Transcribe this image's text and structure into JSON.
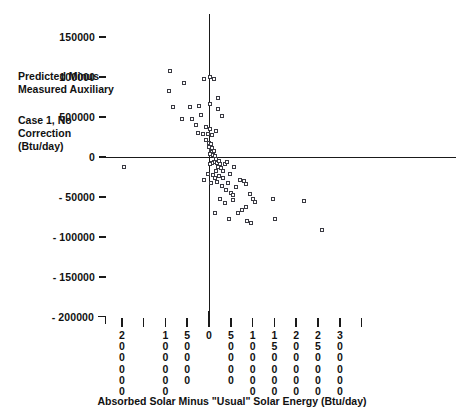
{
  "chart_data": {
    "type": "scatter",
    "title": "",
    "xlabel": "Absorbed Solar Minus \"Usual\" Solar Energy (Btu/day)",
    "ylabel": "Predicted Minus Measured Auxiliary Case 1, No Correction (Btu/day)",
    "ylabel_lines": [
      "Predicted Minus",
      "Measured Auxiliary",
      "Case 1, No",
      "Correction",
      "(Btu/day)"
    ],
    "xlim": [
      -200000,
      350000
    ],
    "ylim": [
      -200000,
      150000
    ],
    "grid": false,
    "legend": null,
    "marker": "open-square",
    "x_ticks": [
      {
        "value": -200000,
        "label": "200000",
        "label_shown": true
      },
      {
        "value": -150000,
        "label": "",
        "label_shown": false
      },
      {
        "value": -100000,
        "label": "100000",
        "label_shown": true
      },
      {
        "value": -50000,
        "label": "50000",
        "label_shown": true
      },
      {
        "value": 0,
        "label": "0",
        "label_shown": true
      },
      {
        "value": 50000,
        "label": "50000",
        "label_shown": true
      },
      {
        "value": 100000,
        "label": "100000",
        "label_shown": true
      },
      {
        "value": 150000,
        "label": "150000",
        "label_shown": true
      },
      {
        "value": 200000,
        "label": "200000",
        "label_shown": true
      },
      {
        "value": 250000,
        "label": "250000",
        "label_shown": true
      },
      {
        "value": 300000,
        "label": "300000",
        "label_shown": true
      },
      {
        "value": 350000,
        "label": "",
        "label_shown": false
      }
    ],
    "y_ticks": [
      {
        "value": 150000,
        "label": "150000"
      },
      {
        "value": 100000,
        "label": "100000"
      },
      {
        "value": 50000,
        "label": "500000"
      },
      {
        "value": 0,
        "label": "0"
      },
      {
        "value": -50000,
        "label": "- 50000"
      },
      {
        "value": -100000,
        "label": "- 100000"
      },
      {
        "value": -150000,
        "label": "- 150000"
      },
      {
        "value": -200000,
        "label": "- 200000"
      }
    ],
    "points": [
      [
        -89000,
        108000
      ],
      [
        -92000,
        82000
      ],
      [
        -58000,
        92000
      ],
      [
        -82000,
        62000
      ],
      [
        -43000,
        63000
      ],
      [
        -24000,
        64000
      ],
      [
        -12000,
        97000
      ],
      [
        -62000,
        48000
      ],
      [
        -38000,
        47000
      ],
      [
        -18000,
        52000
      ],
      [
        -30000,
        40000
      ],
      [
        -8000,
        37000
      ],
      [
        3000,
        100000
      ],
      [
        1500,
        66000
      ],
      [
        11000,
        97000
      ],
      [
        21000,
        74000
      ],
      [
        20000,
        60000
      ],
      [
        30000,
        51000
      ],
      [
        -25000,
        30000
      ],
      [
        -14000,
        29000
      ],
      [
        -2000,
        29000
      ],
      [
        2000,
        35000
      ],
      [
        7000,
        28000
      ],
      [
        16000,
        32000
      ],
      [
        -6000,
        21000
      ],
      [
        1000,
        18000
      ],
      [
        3000,
        14000
      ],
      [
        5000,
        16000
      ],
      [
        -1000,
        12000
      ],
      [
        4000,
        9000
      ],
      [
        6000,
        6000
      ],
      [
        2000,
        4000
      ],
      [
        8000,
        11000
      ],
      [
        12000,
        7000
      ],
      [
        9000,
        2000
      ],
      [
        14000,
        1000
      ],
      [
        16000,
        -3000
      ],
      [
        11000,
        -6000
      ],
      [
        18000,
        -7000
      ],
      [
        6000,
        -8000
      ],
      [
        3000,
        -9000
      ],
      [
        22000,
        -5000
      ],
      [
        25000,
        -9000
      ],
      [
        20000,
        -13000
      ],
      [
        27000,
        -14000
      ],
      [
        16000,
        -17000
      ],
      [
        31000,
        -18000
      ],
      [
        36000,
        -9000
      ],
      [
        41000,
        -6000
      ],
      [
        -3000,
        -21000
      ],
      [
        9000,
        -22000
      ],
      [
        13000,
        -26000
      ],
      [
        24000,
        -24000
      ],
      [
        33000,
        -26000
      ],
      [
        48000,
        -21000
      ],
      [
        58000,
        -12000
      ],
      [
        -12000,
        -29000
      ],
      [
        5000,
        -33000
      ],
      [
        19000,
        -31000
      ],
      [
        29000,
        -36000
      ],
      [
        44000,
        -32000
      ],
      [
        39000,
        -41000
      ],
      [
        61000,
        -37000
      ],
      [
        71000,
        -29000
      ],
      [
        81000,
        -30000
      ],
      [
        84000,
        -34000
      ],
      [
        51000,
        -45000
      ],
      [
        56000,
        -48000
      ],
      [
        56000,
        -54000
      ],
      [
        26000,
        -52000
      ],
      [
        36000,
        -58000
      ],
      [
        95000,
        -46000
      ],
      [
        101000,
        -53000
      ],
      [
        106000,
        -56000
      ],
      [
        86000,
        -62000
      ],
      [
        76000,
        -66000
      ],
      [
        66000,
        -70000
      ],
      [
        14000,
        -70000
      ],
      [
        46000,
        -78000
      ],
      [
        88000,
        -80000
      ],
      [
        96000,
        -83000
      ],
      [
        147000,
        -52000
      ],
      [
        151000,
        -78000
      ],
      [
        219000,
        -55000
      ],
      [
        259000,
        -91000
      ],
      [
        -196000,
        -12000
      ]
    ]
  },
  "axis_geometry": {
    "note": "pixel mapping used for rendering",
    "x_origin_px": 209,
    "y_origin_px": 157,
    "x_scale_px_per_unit": 0.000436,
    "y_scale_px_per_unit": 0.0008
  }
}
